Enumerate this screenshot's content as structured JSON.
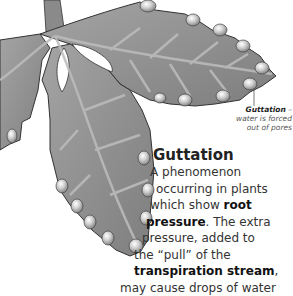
{
  "diagram": {
    "colors": {
      "leaf_fill": "#8e8e8e",
      "leaf_vein": "#b8b8b8",
      "leaf_outline": "#3a3a3a",
      "droplet": "#d0d0d0",
      "background": "#ffffff"
    }
  },
  "callout": {
    "term": "Guttation",
    "dash": " –",
    "description_line1": "water is forced",
    "description_line2": "out of pores"
  },
  "section": {
    "heading": "Guttation",
    "lines": [
      {
        "indent": 30,
        "parts": [
          {
            "text": "A phenomenon",
            "bold": false
          }
        ]
      },
      {
        "indent": 36,
        "parts": [
          {
            "text": "occurring in plants",
            "bold": false
          }
        ]
      },
      {
        "indent": 30,
        "parts": [
          {
            "text": "which show ",
            "bold": false
          },
          {
            "text": "root",
            "bold": true
          }
        ]
      },
      {
        "indent": 26,
        "parts": [
          {
            "text": "pressure",
            "bold": true
          },
          {
            "text": ". The extra",
            "bold": false
          }
        ]
      },
      {
        "indent": 22,
        "parts": [
          {
            "text": "pressure, added to",
            "bold": false
          }
        ]
      },
      {
        "indent": 14,
        "parts": [
          {
            "text": "the “pull” of the",
            "bold": false
          }
        ]
      },
      {
        "indent": 14,
        "parts": [
          {
            "text": "transpiration stream",
            "bold": true
          },
          {
            "text": ",",
            "bold": false
          }
        ]
      },
      {
        "indent": 0,
        "parts": [
          {
            "text": "may cause drops of water",
            "bold": false
          }
        ]
      }
    ]
  }
}
